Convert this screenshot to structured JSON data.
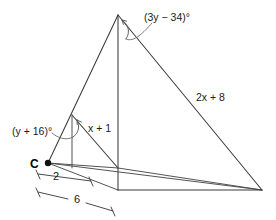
{
  "figure": {
    "type": "geometry-diagram",
    "background_color": "#ffffff",
    "line_color": "#3a3a3a",
    "labels": {
      "point_c": "C",
      "angle_top": "(3y − 34)°",
      "angle_left": "(y + 16)°",
      "side_small": "x + 1",
      "side_large": "2x + 8",
      "dim_small": "2",
      "dim_large": "6"
    },
    "points": {
      "C": {
        "x": 48,
        "y": 163
      },
      "apex_large": {
        "x": 118,
        "y": 15
      },
      "apex_small": {
        "x": 72,
        "y": 115
      },
      "foot_large": {
        "x": 118,
        "y": 190
      },
      "foot_small": {
        "x": 98,
        "y": 168
      },
      "base_right": {
        "x": 262,
        "y": 190
      },
      "mid_right": {
        "x": 118,
        "y": 168
      }
    },
    "dimensions": {
      "small_segment": {
        "label": "2",
        "x1": 38,
        "y1": 175,
        "x2": 92,
        "y2": 182
      },
      "large_segment": {
        "label": "6",
        "x1": 38,
        "y1": 192,
        "x2": 113,
        "y2": 212
      }
    },
    "measures": {
      "angle_top_expression": "3y - 34",
      "angle_left_expression": "y + 16",
      "side_small_expression": "x + 1",
      "side_large_expression": "2x + 8",
      "base_small_value": 2,
      "base_large_value": 6,
      "angle_unit": "degrees"
    }
  }
}
